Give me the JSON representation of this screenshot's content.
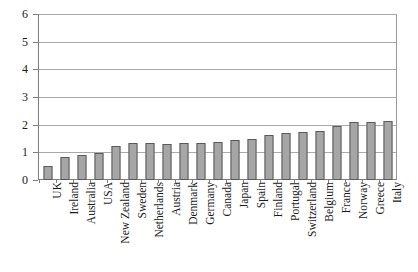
{
  "chart_data": {
    "type": "bar",
    "title": "",
    "xlabel": "",
    "ylabel": "",
    "ylim": [
      0,
      6
    ],
    "ytick_labels": [
      "0",
      "1",
      "2",
      "3",
      "4",
      "5",
      "6"
    ],
    "ytick_values": [
      0,
      1,
      2,
      3,
      4,
      5,
      6
    ],
    "grid": true,
    "legend": "none",
    "orientation": "vertical",
    "bar_color": "#a6a6a6",
    "bar_edge_color": "#5a5a5a",
    "axis_color": "#7d7d7d",
    "gridline_color": "#a9a9a9",
    "categories": [
      "UK",
      "Ireland",
      "Australia",
      "USA",
      "New Zealand",
      "Sweden",
      "Netherlands",
      "Austria",
      "Denmark",
      "Germany",
      "Canada",
      "Japan",
      "Spain",
      "Finland",
      "Portugal",
      "Switzerland",
      "Belgium",
      "France",
      "Norway",
      "Greece",
      "Italy"
    ],
    "values": [
      0.5,
      0.85,
      0.92,
      1.0,
      1.22,
      1.33,
      1.33,
      1.32,
      1.35,
      1.35,
      1.4,
      1.45,
      1.5,
      1.65,
      1.7,
      1.75,
      1.8,
      1.95,
      2.1,
      2.1,
      2.15
    ]
  }
}
